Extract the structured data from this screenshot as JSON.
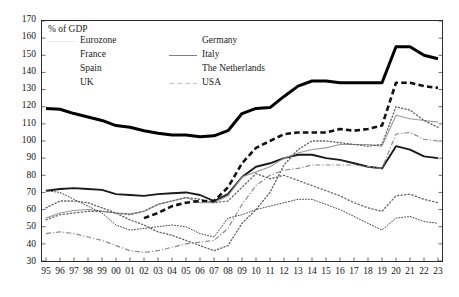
{
  "chart_data": {
    "type": "line",
    "title": "",
    "subtitle": "",
    "ylabel": "% of GDP",
    "xlabel": "",
    "ylim": [
      30,
      170
    ],
    "ytick_step": 10,
    "yticks": [
      170,
      160,
      150,
      140,
      130,
      120,
      110,
      100,
      90,
      80,
      70,
      60,
      50,
      40,
      30
    ],
    "grid": false,
    "legend_position": "top-left-inside",
    "x": [
      "95",
      "96",
      "97",
      "98",
      "99",
      "00",
      "01",
      "02",
      "03",
      "04",
      "05",
      "06",
      "07",
      "08",
      "09",
      "10",
      "11",
      "12",
      "13",
      "14",
      "15",
      "16",
      "17",
      "18",
      "19",
      "20",
      "21",
      "22",
      "23"
    ],
    "x_full_years": [
      1995,
      1996,
      1997,
      1998,
      1999,
      2000,
      2001,
      2002,
      2003,
      2004,
      2005,
      2006,
      2007,
      2008,
      2009,
      2010,
      2011,
      2012,
      2013,
      2014,
      2015,
      2016,
      2017,
      2018,
      2019,
      2020,
      2021,
      2022,
      2023
    ],
    "series": [
      {
        "name": "Eurozone",
        "style": "solid",
        "width": 1.9,
        "color": "#1a1a1a",
        "values": [
          71,
          72,
          72.5,
          72,
          71.5,
          69,
          68.5,
          68,
          69,
          69.5,
          70,
          68.5,
          65,
          69,
          79,
          85,
          87,
          90,
          92,
          92,
          90,
          89,
          87,
          85,
          84,
          97,
          95,
          91,
          90
        ]
      },
      {
        "name": "France",
        "style": "solid",
        "width": 1.1,
        "color": "#9a9a9a",
        "values": [
          55,
          58,
          59.5,
          60,
          59,
          58,
          57.5,
          59,
          63,
          65,
          67,
          64,
          64,
          68,
          79,
          82,
          85,
          90,
          93,
          95,
          96,
          98,
          98,
          98,
          97,
          115,
          113,
          112,
          111
        ]
      },
      {
        "name": "Spain",
        "style": "dotted",
        "width": 1.3,
        "color": "#5e5e5e",
        "values": [
          61,
          65,
          65,
          64,
          61,
          58,
          54,
          51,
          47,
          45,
          42,
          39,
          36,
          39,
          52,
          60,
          70,
          86,
          95,
          100,
          100,
          99,
          98,
          97,
          98,
          120,
          118,
          112,
          108
        ]
      },
      {
        "name": "UK",
        "style": "dashdot",
        "width": 1.2,
        "color": "#8c8c8c",
        "values": [
          46,
          47,
          46,
          44,
          42,
          39,
          36,
          35,
          36,
          38,
          40,
          41,
          42,
          49,
          63,
          74,
          80,
          83,
          84,
          86,
          86,
          86,
          86,
          85,
          84,
          104,
          105,
          101,
          100
        ]
      },
      {
        "name": "Germany",
        "style": "dotted",
        "width": 1.4,
        "color": "#6f6f6f",
        "values": [
          54,
          57,
          58,
          59,
          59,
          58,
          57,
          59,
          63,
          65,
          67,
          66,
          64,
          65,
          73,
          81,
          78,
          80,
          77,
          74,
          71,
          68,
          64,
          61,
          59,
          68,
          69,
          66,
          64
        ]
      },
      {
        "name": "Italy",
        "style": "solid",
        "width": 3.0,
        "color": "#000000",
        "values": [
          119,
          118.5,
          116,
          114,
          112,
          109,
          108,
          106,
          104.5,
          103.5,
          103.5,
          102.5,
          103,
          106,
          116,
          119,
          119.5,
          126,
          132,
          135,
          135,
          134,
          134,
          134,
          134,
          155,
          155,
          150,
          148
        ]
      },
      {
        "name": "The Netherlands",
        "style": "dotted-fine",
        "width": 1.0,
        "color": "#4a4a4a",
        "values": [
          71,
          70,
          66,
          62,
          58,
          51,
          48,
          49,
          50,
          51,
          50,
          46,
          44,
          55,
          57,
          60,
          62,
          64,
          66,
          66,
          63,
          60,
          56,
          52,
          48,
          55,
          56,
          53,
          52
        ]
      },
      {
        "name": "USA",
        "style": "dashed",
        "width": 2.6,
        "color": "#111111",
        "values": [
          null,
          null,
          null,
          null,
          null,
          null,
          null,
          55,
          58,
          62,
          64,
          65,
          65,
          73,
          87,
          96,
          100,
          104,
          105,
          105,
          105,
          107,
          106,
          107,
          109,
          134,
          134,
          132,
          131
        ]
      }
    ]
  },
  "legend": {
    "title": "% of GDP",
    "items": [
      {
        "label": "Eurozone",
        "style": "solid-bold"
      },
      {
        "label": "Germany",
        "style": "dotted"
      },
      {
        "label": "France",
        "style": "solid-gray"
      },
      {
        "label": "Italy",
        "style": "solid-heavy"
      },
      {
        "label": "Spain",
        "style": "dotted-light"
      },
      {
        "label": "The Netherlands",
        "style": "dotted-fine"
      },
      {
        "label": "UK",
        "style": "dashdot"
      },
      {
        "label": "USA",
        "style": "dashed"
      }
    ]
  }
}
